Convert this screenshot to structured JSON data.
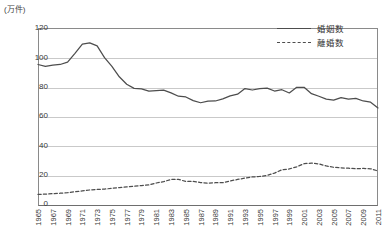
{
  "unit_label": "(万件)",
  "legend": {
    "position": "top-right",
    "items": [
      {
        "label": "婚姻数",
        "style": "solid",
        "color": "#4d4d4d"
      },
      {
        "label": "離婚数",
        "style": "dashed",
        "color": "#4d4d4d"
      }
    ]
  },
  "axes": {
    "y_ticks": [
      "120",
      "100",
      "80",
      "60",
      "40",
      "20",
      "0"
    ],
    "x_ticks": [
      "1965",
      "1967",
      "1969",
      "1971",
      "1973",
      "1975",
      "1977",
      "1979",
      "1981",
      "1983",
      "1985",
      "1987",
      "1989",
      "1991",
      "1993",
      "1995",
      "1997",
      "1999",
      "2001",
      "2003",
      "2005",
      "2007",
      "2009",
      "2011"
    ]
  },
  "chart_data": {
    "type": "line",
    "title": "",
    "subtitle": "",
    "xlabel": "",
    "ylabel": "(万件)",
    "ylim": [
      0,
      120
    ],
    "xlim": [
      1965,
      2011
    ],
    "grid": true,
    "legend_position": "top-right",
    "x": [
      1965,
      1966,
      1967,
      1968,
      1969,
      1970,
      1971,
      1972,
      1973,
      1974,
      1975,
      1976,
      1977,
      1978,
      1979,
      1980,
      1981,
      1982,
      1983,
      1984,
      1985,
      1986,
      1987,
      1988,
      1989,
      1990,
      1991,
      1992,
      1993,
      1994,
      1995,
      1996,
      1997,
      1998,
      1999,
      2000,
      2001,
      2002,
      2003,
      2004,
      2005,
      2006,
      2007,
      2008,
      2009,
      2010,
      2011
    ],
    "series": [
      {
        "name": "婚姻数",
        "style": "solid",
        "color": "#4d4d4d",
        "values": [
          95.4,
          94.1,
          95.0,
          95.4,
          97.0,
          102.9,
          109.1,
          110.0,
          108.0,
          100.0,
          94.1,
          87.1,
          82.1,
          79.3,
          78.9,
          77.4,
          77.7,
          78.1,
          76.3,
          74.0,
          73.5,
          71.0,
          69.6,
          70.7,
          70.8,
          72.2,
          74.2,
          75.4,
          79.2,
          78.2,
          79.1,
          79.5,
          77.5,
          78.4,
          76.2,
          80.0,
          80.0,
          75.7,
          74.0,
          72.0,
          71.4,
          73.1,
          72.0,
          72.6,
          70.8,
          70.0,
          66.1
        ]
      },
      {
        "name": "離婚数",
        "style": "dashed",
        "color": "#4d4d4d",
        "values": [
          7.8,
          8.0,
          8.3,
          8.6,
          9.0,
          9.6,
          10.2,
          10.8,
          11.2,
          11.4,
          11.9,
          12.4,
          12.9,
          13.3,
          13.8,
          14.2,
          15.5,
          16.4,
          17.9,
          17.9,
          16.6,
          16.6,
          15.8,
          15.4,
          15.7,
          15.7,
          16.9,
          17.9,
          18.8,
          19.6,
          19.9,
          20.6,
          22.2,
          24.4,
          25.0,
          26.4,
          28.5,
          28.9,
          28.4,
          27.0,
          26.1,
          25.7,
          25.5,
          25.1,
          25.3,
          25.1,
          23.6
        ]
      }
    ]
  }
}
